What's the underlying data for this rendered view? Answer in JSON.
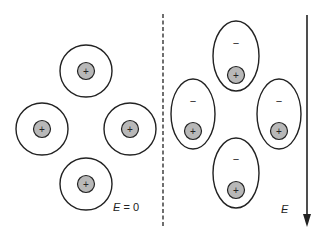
{
  "left_panel": {
    "label_var": "E",
    "label_rest": " = 0",
    "atoms": [
      {
        "cx": 86,
        "cy": 71,
        "r": 26,
        "nucleus_sign": "+"
      },
      {
        "cx": 42,
        "cy": 129,
        "r": 26,
        "nucleus_sign": "+"
      },
      {
        "cx": 130,
        "cy": 129,
        "r": 26,
        "nucleus_sign": "+"
      },
      {
        "cx": 86,
        "cy": 184,
        "r": 26,
        "nucleus_sign": "+"
      }
    ]
  },
  "right_panel": {
    "label": "E",
    "atoms": [
      {
        "cx": 236,
        "cy": 56,
        "rx": 23,
        "ry": 35,
        "nucleus_sign": "+",
        "cloud_sign": "−"
      },
      {
        "cx": 193,
        "cy": 114,
        "rx": 22,
        "ry": 35,
        "nucleus_sign": "+",
        "cloud_sign": "−"
      },
      {
        "cx": 279,
        "cy": 114,
        "rx": 22,
        "ry": 35,
        "nucleus_sign": "+",
        "cloud_sign": "−"
      },
      {
        "cx": 236,
        "cy": 173,
        "rx": 23,
        "ry": 35,
        "nucleus_sign": "+",
        "cloud_sign": "−"
      }
    ]
  },
  "colors": {
    "stroke": "#222222",
    "nucleus_fill": "#b8b8b8",
    "background": "#ffffff"
  }
}
